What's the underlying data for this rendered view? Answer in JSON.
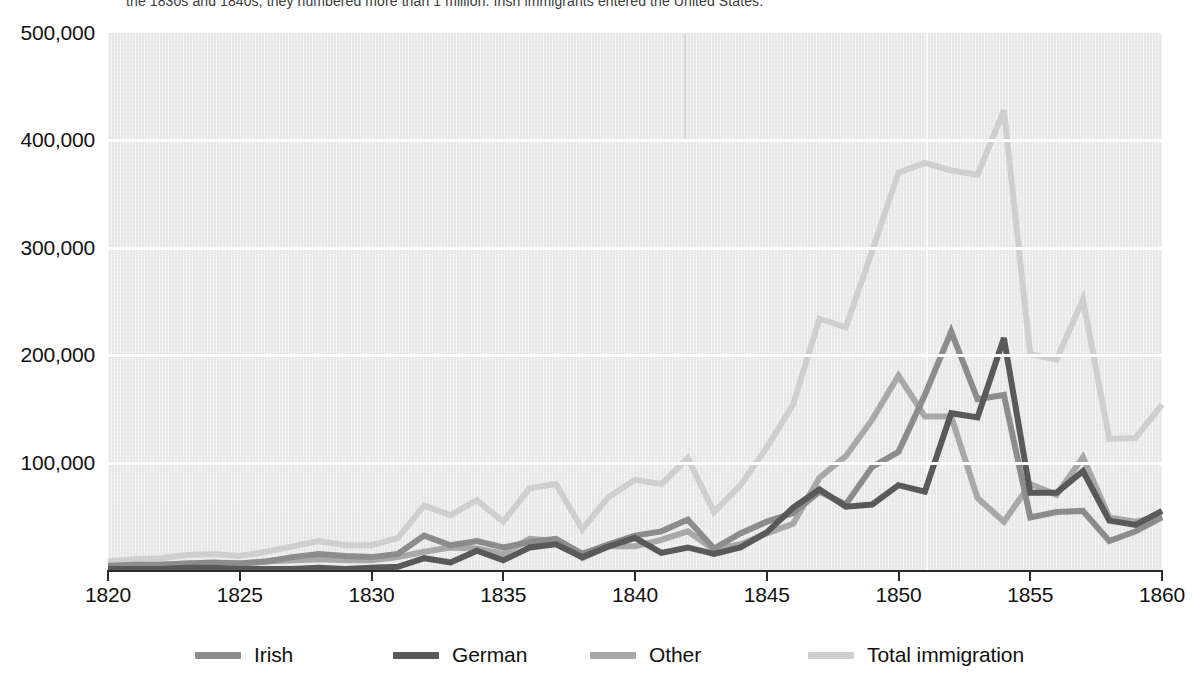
{
  "caption": {
    "text": "the 1830s and 1840s, they numbered more than 1 million. Irish immigrants entered the United States."
  },
  "axes": {
    "y_ticks": [
      "100,000",
      "200,000",
      "300,000",
      "400,000",
      "500,000"
    ],
    "y_tick_values": [
      100000,
      200000,
      300000,
      400000,
      500000
    ],
    "x_ticks": [
      "1820",
      "1825",
      "1830",
      "1835",
      "1840",
      "1845",
      "1850",
      "1855",
      "1860"
    ],
    "x_tick_values": [
      1820,
      1825,
      1830,
      1835,
      1840,
      1845,
      1850,
      1855,
      1860
    ]
  },
  "legend": {
    "items": [
      {
        "label": "Irish",
        "color": "#8c8c8c"
      },
      {
        "label": "German",
        "color": "#595959"
      },
      {
        "label": "Other",
        "color": "#a8a8a8"
      },
      {
        "label": "Total immigration",
        "color": "#cfcfcf"
      }
    ]
  },
  "colors": {
    "plot_background": "#e9e9e9",
    "gridline": "#ffffff",
    "axis": "#2a2a2a",
    "text": "#111111"
  },
  "chart_data": {
    "type": "line",
    "title": "",
    "subtitle": "",
    "xlabel": "",
    "ylabel": "",
    "xlim": [
      1820,
      1860
    ],
    "ylim": [
      0,
      500000
    ],
    "grid": true,
    "legend_position": "bottom",
    "x": [
      1820,
      1821,
      1822,
      1823,
      1824,
      1825,
      1826,
      1827,
      1828,
      1829,
      1830,
      1831,
      1832,
      1833,
      1834,
      1835,
      1836,
      1837,
      1838,
      1839,
      1840,
      1841,
      1842,
      1843,
      1844,
      1845,
      1846,
      1847,
      1848,
      1849,
      1850,
      1851,
      1852,
      1853,
      1854,
      1855,
      1856,
      1857,
      1858,
      1859,
      1860
    ],
    "series": [
      {
        "name": "Irish",
        "color": "#8c8c8c",
        "values": [
          4000,
          5000,
          5000,
          6000,
          7000,
          6000,
          8000,
          12000,
          15000,
          13000,
          12000,
          15000,
          32000,
          23000,
          27000,
          21000,
          26000,
          29000,
          15000,
          24000,
          32000,
          36000,
          47000,
          20000,
          34000,
          45000,
          53000,
          73000,
          61000,
          96000,
          110000,
          163000,
          222000,
          159000,
          163000,
          49000,
          54000,
          55000,
          27000,
          36000,
          49000
        ],
        "peak": {
          "year": 1852,
          "value": 222000
        }
      },
      {
        "name": "German",
        "color": "#595959",
        "values": [
          1000,
          1000,
          1000,
          2000,
          2000,
          1000,
          1000,
          1000,
          2000,
          1000,
          2000,
          3000,
          11000,
          7000,
          18000,
          9000,
          21000,
          24000,
          12000,
          22000,
          30000,
          16000,
          21000,
          15000,
          21000,
          35000,
          58000,
          75000,
          59000,
          61000,
          79000,
          73000,
          146000,
          142000,
          216000,
          72000,
          72000,
          92000,
          46000,
          42000,
          55000
        ],
        "peak": {
          "year": 1854,
          "value": 216000
        }
      },
      {
        "name": "Other",
        "color": "#a8a8a8",
        "values": [
          3000,
          4000,
          5000,
          6000,
          6000,
          6000,
          8000,
          9000,
          10000,
          9000,
          9000,
          12000,
          17000,
          21000,
          20000,
          15000,
          29000,
          27000,
          11000,
          22000,
          22000,
          28000,
          36000,
          19000,
          24000,
          34000,
          43000,
          86000,
          106000,
          140000,
          181000,
          143000,
          143000,
          67000,
          45000,
          80000,
          70000,
          105000,
          49000,
          45000,
          50000
        ],
        "peak": {
          "year": 1850,
          "value": 181000
        }
      },
      {
        "name": "Total immigration",
        "color": "#cfcfcf",
        "values": [
          8000,
          10000,
          11000,
          14000,
          15000,
          13000,
          17000,
          22000,
          27000,
          23000,
          23000,
          30000,
          60000,
          51000,
          65000,
          45000,
          76000,
          80000,
          38000,
          68000,
          84000,
          80000,
          104000,
          54000,
          79000,
          114000,
          154000,
          234000,
          226000,
          297000,
          370000,
          379000,
          372000,
          368000,
          428000,
          201000,
          196000,
          252000,
          122000,
          123000,
          154000
        ],
        "peak": {
          "year": 1854,
          "value": 428000
        }
      }
    ]
  }
}
